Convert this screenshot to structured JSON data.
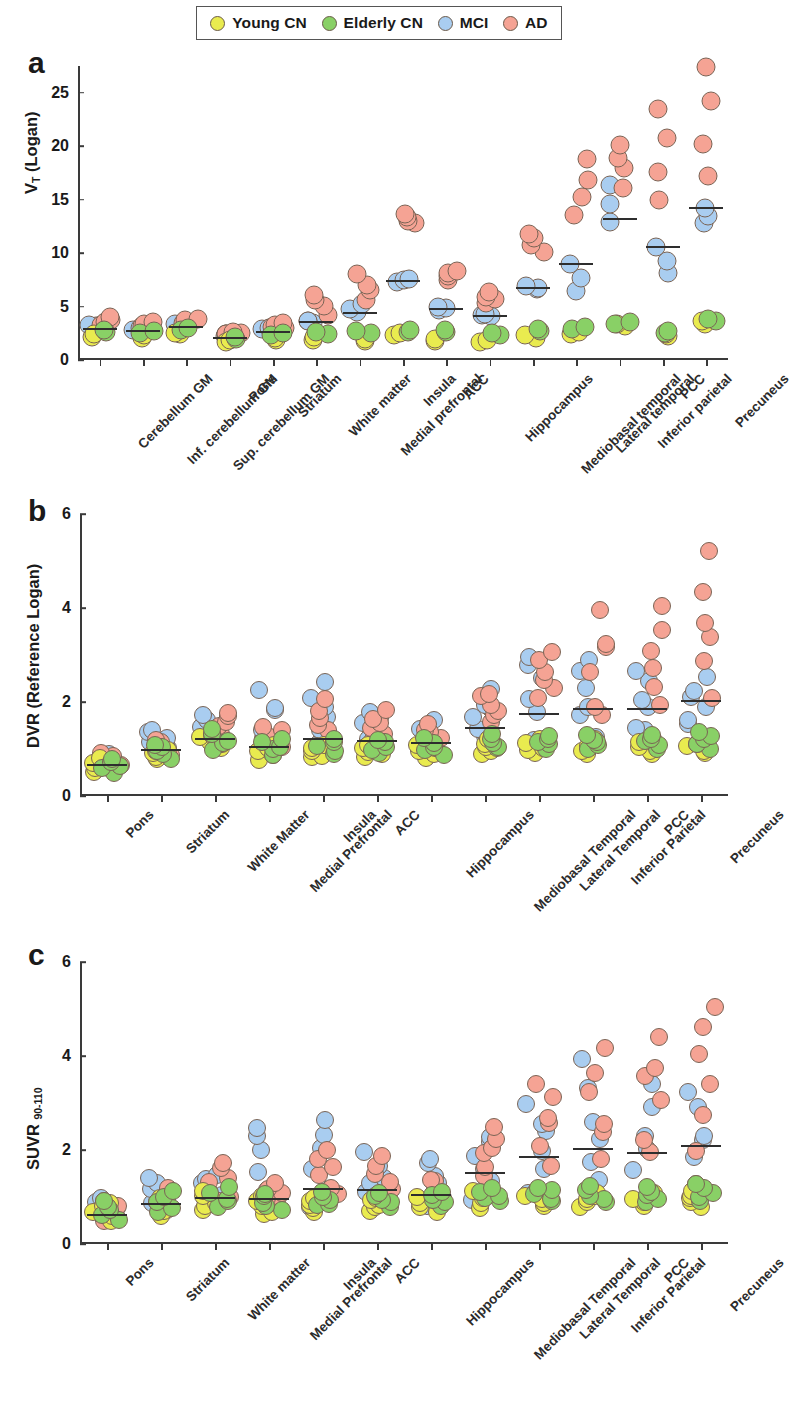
{
  "legend": {
    "items": [
      {
        "label": "Young CN",
        "color": "#e9eb4f",
        "key": "young_cn"
      },
      {
        "label": "Elderly CN",
        "color": "#89d066",
        "key": "elderly_cn"
      },
      {
        "label": "MCI",
        "color": "#a9cdf0",
        "key": "mci"
      },
      {
        "label": "AD",
        "color": "#f5a394",
        "key": "ad"
      }
    ]
  },
  "panels": [
    {
      "letter": "a",
      "ylabel_html": "V<sub>T</sub> (Logan)"
    },
    {
      "letter": "b",
      "ylabel_html": "DVR (Reference Logan)"
    },
    {
      "letter": "c",
      "ylabel_html": "SUVR <sub>90-110</sub>"
    }
  ],
  "chart_data": [
    {
      "panel": "a",
      "type": "scatter",
      "title": "",
      "xlabel": "",
      "ylabel": "V_T (Logan)",
      "ylim": [
        0,
        27.5
      ],
      "yticks": [
        0,
        5,
        10,
        15,
        20,
        25
      ],
      "grid": false,
      "legend_position": "top",
      "groups": [
        "Young CN",
        "Elderly CN",
        "MCI",
        "AD"
      ],
      "categories": [
        "Cerebellum GM",
        "Inf. cerebellum GM",
        "Sup. cerebellum GM",
        "Pons",
        "Striatum",
        "White matter",
        "Medial prefrontal",
        "Insula",
        "ACC",
        "Hippocampus",
        "Mediobasal temporal",
        "Lateral temporal",
        "Inferior parietal",
        "PCC",
        "Precuneus"
      ],
      "means": [
        2.9,
        2.7,
        3.1,
        2.1,
        2.6,
        3.6,
        4.4,
        7.4,
        4.8,
        4.1,
        6.7,
        9.0,
        13.2,
        10.6,
        14.2
      ],
      "series": [
        {
          "name": "Young CN",
          "values": [
            [
              2.2,
              2.4
            ],
            [
              2.1,
              2.3
            ],
            [
              2.4,
              2.5
            ],
            [
              1.7,
              1.9
            ],
            [
              1.9,
              2.1
            ],
            [
              1.9,
              2.2
            ],
            [
              1.8,
              2.0
            ],
            [
              2.3,
              2.5
            ],
            [
              1.8,
              2.0
            ],
            [
              1.7,
              1.9
            ],
            [
              2.1,
              2.3
            ],
            [
              2.4,
              2.6
            ],
            [
              3.2,
              3.4
            ],
            [
              2.2,
              2.4
            ],
            [
              3.4,
              3.6
            ]
          ]
        },
        {
          "name": "Elderly CN",
          "values": [
            [
              2.6,
              2.8
            ],
            [
              2.5,
              2.7
            ],
            [
              2.8,
              3.0
            ],
            [
              2.0,
              2.2
            ],
            [
              2.3,
              2.5
            ],
            [
              2.4,
              2.6
            ],
            [
              2.5,
              2.7
            ],
            [
              2.6,
              2.8
            ],
            [
              2.6,
              2.8
            ],
            [
              2.3,
              2.5
            ],
            [
              2.7,
              2.9
            ],
            [
              2.9,
              3.1
            ],
            [
              3.4,
              3.6
            ],
            [
              2.5,
              2.7
            ],
            [
              3.6,
              3.8
            ]
          ]
        },
        {
          "name": "MCI",
          "values": [
            [
              3.1,
              3.3
            ],
            [
              2.8,
              3.0
            ],
            [
              3.2,
              3.4
            ],
            [
              2.2,
              2.4
            ],
            [
              2.8,
              3.0
            ],
            [
              3.5,
              3.7
            ],
            [
              4.5,
              5.2
            ],
            [
              7.3,
              7.6
            ],
            [
              4.7,
              5.0
            ],
            [
              4.1,
              4.3
            ],
            [
              6.6,
              6.9
            ],
            [
              6.6,
              9.1
            ],
            [
              13.1,
              16.4
            ],
            [
              8.2,
              10.5
            ],
            [
              12.8,
              14.2
            ]
          ]
        },
        {
          "name": "AD",
          "values": [
            [
              3.3,
              4.0
            ],
            [
              3.1,
              3.5
            ],
            [
              3.5,
              3.8
            ],
            [
              2.4,
              2.6
            ],
            [
              3.0,
              3.4
            ],
            [
              4.4,
              6.1
            ],
            [
              5.6,
              7.9
            ],
            [
              12.8,
              13.6
            ],
            [
              7.5,
              8.4
            ],
            [
              5.2,
              6.4
            ],
            [
              10.1,
              11.9
            ],
            [
              13.5,
              18.6
            ],
            [
              16.3,
              20.4
            ],
            [
              15.2,
              23.2
            ],
            [
              17.4,
              27.2
            ]
          ]
        }
      ]
    },
    {
      "panel": "b",
      "type": "scatter",
      "title": "",
      "xlabel": "",
      "ylabel": "DVR (Reference Logan)",
      "ylim": [
        0,
        6
      ],
      "yticks": [
        0,
        2,
        4,
        6
      ],
      "grid": false,
      "legend_position": "top",
      "groups": [
        "Young CN",
        "Elderly CN",
        "MCI",
        "AD"
      ],
      "categories": [
        "Pons",
        "Striatum",
        "White Matter",
        "Medial Prefrontal",
        "Insula",
        "ACC",
        "Hippocampus",
        "Mediobasal Temporal",
        "Lateral Temporal",
        "Inferior Parietal",
        "PCC",
        "Precuneus"
      ],
      "means": [
        0.65,
        0.98,
        1.22,
        1.05,
        1.22,
        1.18,
        1.12,
        1.45,
        1.74,
        1.86,
        1.85,
        2.02
      ],
      "series": [
        {
          "name": "Young CN",
          "values": [
            [
              0.5,
              0.8
            ],
            [
              0.8,
              1.0
            ],
            [
              1.0,
              1.3
            ],
            [
              0.8,
              1.1
            ],
            [
              0.8,
              1.1
            ],
            [
              0.8,
              1.1
            ],
            [
              0.8,
              1.1
            ],
            [
              0.9,
              1.2
            ],
            [
              0.9,
              1.2
            ],
            [
              0.9,
              1.2
            ],
            [
              0.9,
              1.2
            ],
            [
              0.9,
              1.2
            ]
          ]
        },
        {
          "name": "Elderly CN",
          "values": [
            [
              0.5,
              0.8
            ],
            [
              0.8,
              1.1
            ],
            [
              1.0,
              1.4
            ],
            [
              0.9,
              1.2
            ],
            [
              0.9,
              1.2
            ],
            [
              0.9,
              1.2
            ],
            [
              0.9,
              1.2
            ],
            [
              1.0,
              1.3
            ],
            [
              1.0,
              1.3
            ],
            [
              1.0,
              1.3
            ],
            [
              1.0,
              1.3
            ],
            [
              1.0,
              1.4
            ]
          ]
        },
        {
          "name": "MCI",
          "values": [
            [
              0.6,
              0.9
            ],
            [
              1.0,
              1.4
            ],
            [
              1.2,
              1.7
            ],
            [
              1.0,
              2.2
            ],
            [
              1.1,
              2.4
            ],
            [
              1.1,
              1.8
            ],
            [
              1.1,
              1.6
            ],
            [
              1.2,
              2.2
            ],
            [
              1.3,
              3.1
            ],
            [
              1.4,
              3.0
            ],
            [
              1.3,
              2.6
            ],
            [
              1.5,
              2.5
            ]
          ]
        },
        {
          "name": "AD",
          "values": [
            [
              0.6,
              0.9
            ],
            [
              0.9,
              1.2
            ],
            [
              1.2,
              1.8
            ],
            [
              1.0,
              1.5
            ],
            [
              1.2,
              2.0
            ],
            [
              1.2,
              1.8
            ],
            [
              1.1,
              1.5
            ],
            [
              1.6,
              2.2
            ],
            [
              2.0,
              3.1
            ],
            [
              1.6,
              3.9
            ],
            [
              1.8,
              4.1
            ],
            [
              2.2,
              5.0
            ]
          ]
        }
      ]
    },
    {
      "panel": "c",
      "type": "scatter",
      "title": "",
      "xlabel": "",
      "ylabel": "SUVR 90-110",
      "ylim": [
        0,
        6
      ],
      "yticks": [
        0,
        2,
        4,
        6
      ],
      "grid": false,
      "legend_position": "top",
      "groups": [
        "Young CN",
        "Elderly CN",
        "MCI",
        "AD"
      ],
      "categories": [
        "Pons",
        "Striatum",
        "White matter",
        "Medial Prefrontal",
        "Insula",
        "ACC",
        "Hippocampus",
        "Mediobasal Temporal",
        "Lateral Temporal",
        "Inferior Parietal",
        "PCC",
        "Precuneus"
      ],
      "means": [
        0.62,
        0.85,
        0.98,
        0.95,
        1.18,
        1.15,
        1.05,
        1.52,
        1.86,
        2.03,
        1.93,
        2.08
      ],
      "series": [
        {
          "name": "Young CN",
          "values": [
            [
              0.45,
              0.9
            ],
            [
              0.6,
              1.0
            ],
            [
              0.7,
              1.1
            ],
            [
              0.6,
              1.0
            ],
            [
              0.7,
              1.0
            ],
            [
              0.7,
              1.0
            ],
            [
              0.7,
              1.0
            ],
            [
              0.8,
              1.1
            ],
            [
              0.8,
              1.1
            ],
            [
              0.8,
              1.1
            ],
            [
              0.8,
              1.1
            ],
            [
              0.8,
              1.1
            ]
          ]
        },
        {
          "name": "Elderly CN",
          "values": [
            [
              0.5,
              0.9
            ],
            [
              0.7,
              1.1
            ],
            [
              0.8,
              1.2
            ],
            [
              0.7,
              1.1
            ],
            [
              0.8,
              1.1
            ],
            [
              0.8,
              1.1
            ],
            [
              0.8,
              1.1
            ],
            [
              0.9,
              1.2
            ],
            [
              0.9,
              1.2
            ],
            [
              0.9,
              1.2
            ],
            [
              0.9,
              1.2
            ],
            [
              0.9,
              1.3
            ]
          ]
        },
        {
          "name": "MCI",
          "values": [
            [
              0.55,
              0.95
            ],
            [
              0.8,
              1.4
            ],
            [
              0.9,
              1.5
            ],
            [
              0.9,
              2.5
            ],
            [
              0.9,
              2.7
            ],
            [
              0.9,
              1.9
            ],
            [
              0.9,
              1.9
            ],
            [
              1.0,
              2.4
            ],
            [
              1.2,
              3.0
            ],
            [
              1.2,
              3.9
            ],
            [
              1.2,
              3.3
            ],
            [
              1.3,
              3.2
            ]
          ]
        },
        {
          "name": "AD",
          "values": [
            [
              0.5,
              0.9
            ],
            [
              0.7,
              1.2
            ],
            [
              0.9,
              1.8
            ],
            [
              0.8,
              1.3
            ],
            [
              1.0,
              2.0
            ],
            [
              1.0,
              1.8
            ],
            [
              0.9,
              1.4
            ],
            [
              1.5,
              2.5
            ],
            [
              1.8,
              3.4
            ],
            [
              1.7,
              4.2
            ],
            [
              1.8,
              4.4
            ],
            [
              2.0,
              5.2
            ]
          ]
        }
      ]
    }
  ]
}
